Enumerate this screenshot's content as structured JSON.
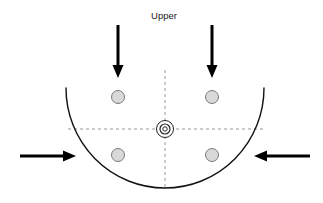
{
  "figure": {
    "title": "",
    "labels": [
      {
        "id": "upper",
        "text": "Upper",
        "x": 164,
        "y": 19,
        "anchor": "middle"
      }
    ]
  },
  "colors": {
    "outline": "#111111",
    "arrow": "#000000",
    "dashed_axis": "#999999",
    "node_fill": "#d9d9d9",
    "node_stroke": "#7a7a7a",
    "center_stroke": "#222222",
    "background": "#ffffff"
  },
  "geometry": {
    "center": {
      "x": 165,
      "y": 129
    },
    "bowl": {
      "shape": "semicircular-arc",
      "cx": 165,
      "cy": 88,
      "rx": 99,
      "ry": 100,
      "left_top": {
        "x": 66,
        "y": 88
      },
      "right_top": {
        "x": 264,
        "y": 88
      },
      "bottom": {
        "x": 165,
        "y": 188
      },
      "stroke_width": 1.4
    },
    "axes": [
      {
        "id": "horizontal-axis",
        "orientation": "horizontal",
        "x1": 68,
        "y1": 129,
        "x2": 263,
        "y2": 129,
        "dash": "3 3"
      },
      {
        "id": "vertical-axis",
        "orientation": "vertical",
        "x1": 165,
        "y1": 70,
        "x2": 165,
        "y2": 190,
        "dash": "3 3"
      }
    ],
    "nodes": [
      {
        "id": "node-upper-left",
        "x": 118,
        "y": 97,
        "r": 6.5
      },
      {
        "id": "node-upper-right",
        "x": 212,
        "y": 97,
        "r": 6.5
      },
      {
        "id": "node-lower-left",
        "x": 118,
        "y": 155,
        "r": 6.5
      },
      {
        "id": "node-lower-right",
        "x": 212,
        "y": 155,
        "r": 6.5
      }
    ],
    "center_marker": {
      "id": "center-target-marker",
      "x": 165,
      "y": 129,
      "outer_r": 8.5,
      "mid_r": 5.0,
      "inner_r": 2.2
    },
    "arrows": [
      {
        "id": "arrow-top-left",
        "direction": "down",
        "x1": 118,
        "y1": 25,
        "x2": 118,
        "y2": 78,
        "shaft_width": 3.0,
        "head_width": 11,
        "head_length": 13
      },
      {
        "id": "arrow-top-right",
        "direction": "down",
        "x1": 212,
        "y1": 25,
        "x2": 212,
        "y2": 78,
        "shaft_width": 3.0,
        "head_width": 11,
        "head_length": 13
      },
      {
        "id": "arrow-left",
        "direction": "right",
        "x1": 20,
        "y1": 156,
        "x2": 76,
        "y2": 156,
        "shaft_width": 3.0,
        "head_width": 11,
        "head_length": 13
      },
      {
        "id": "arrow-right",
        "direction": "left",
        "x1": 310,
        "y1": 156,
        "x2": 254,
        "y2": 156,
        "shaft_width": 3.0,
        "head_width": 11,
        "head_length": 13
      }
    ]
  }
}
